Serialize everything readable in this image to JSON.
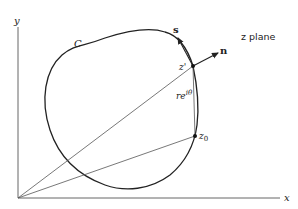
{
  "diagram": {
    "plane_label": "z plane",
    "axes": {
      "x_label": "x",
      "y_label": "y"
    },
    "contour_label": "C",
    "points": {
      "z_prime": {
        "label": "z'"
      },
      "z0": {
        "label": "z",
        "subscript": "0"
      }
    },
    "vectors": {
      "tangent": {
        "label": "s"
      },
      "normal": {
        "label": "n"
      }
    },
    "segment_label": {
      "base": "re",
      "superscript": "iθ"
    },
    "colors": {
      "stroke": "#222222",
      "background": "#ffffff"
    }
  }
}
